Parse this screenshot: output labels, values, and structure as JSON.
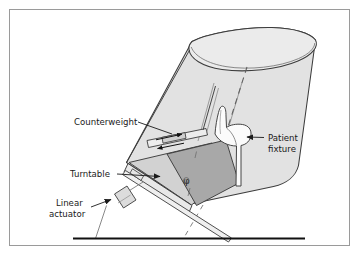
{
  "figure": {
    "type": "technical-diagram",
    "background_color": "#ffffff",
    "border_color": "#9a9a9a"
  },
  "colors": {
    "cylinder_fill": "#e2e2e2",
    "cylinder_top_fill": "#ebebeb",
    "platform_fill": "#d2d2d2",
    "turntable_fill": "#a8a8a8",
    "fixture_fill": "#fbfbfb",
    "actuator_fill": "#dcdcdc",
    "outline": "#3c3c3c",
    "ground_line": "#111111",
    "dash_line": "#6e6e6e",
    "leader_line": "#1a1a1a"
  },
  "labels": {
    "counterweight": {
      "text": "Counterweight",
      "lines": [
        "Counterweight"
      ]
    },
    "turntable": {
      "text": "Turntable",
      "lines": [
        "Turntable"
      ]
    },
    "linear_actuator": {
      "text": "Linear actuator",
      "lines": [
        "Linear",
        "actuator"
      ]
    },
    "patient_fixture": {
      "text": "Patient fixture",
      "lines": [
        "Patient",
        "fixture"
      ]
    },
    "rotation_angle": {
      "text": "φ",
      "meaning": "turntable rotation angle phi"
    }
  },
  "annotations": {
    "counterweight_motion": "bidirectional sliding arrows along counterweight rail",
    "tilt_axis": "dashed centerline through cylinder axis down to ground",
    "ground": "horizontal floor reference line"
  }
}
